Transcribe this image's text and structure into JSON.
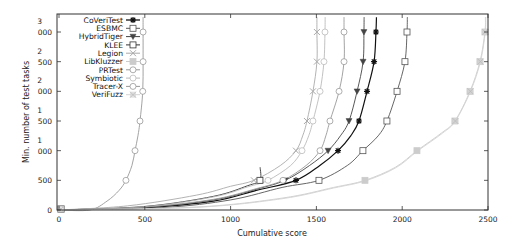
{
  "chart_data": {
    "type": "line",
    "title": "",
    "xlabel": "Cumulative score",
    "ylabel": "Min. number of test tasks",
    "xlim": [
      0,
      2500
    ],
    "ylim": [
      0,
      3000
    ],
    "x_ticks": [
      0,
      500,
      1000,
      1500,
      2000,
      2500
    ],
    "x_tick_labels": [
      "0",
      "500",
      "1000",
      "1500",
      "2000",
      "2500"
    ],
    "y_ticks": [
      0,
      500,
      1000,
      1500,
      2000,
      2500,
      3000
    ],
    "y_tick_labels": [
      [
        "0"
      ],
      [
        "500"
      ],
      [
        "1",
        "000"
      ],
      [
        "1",
        "500"
      ],
      [
        "2",
        "000"
      ],
      [
        "2",
        "500"
      ],
      [
        "3",
        "000"
      ]
    ],
    "grid": false,
    "legend_position": "top-left",
    "series": [
      {
        "name": "CoVeriTest",
        "color": "#111111",
        "marker": "star",
        "points": [
          [
            0,
            0
          ],
          [
            500,
            40
          ],
          [
            900,
            150
          ],
          [
            1150,
            330
          ],
          [
            1381,
            500
          ],
          [
            1520,
            750
          ],
          [
            1626,
            1000
          ],
          [
            1700,
            1250
          ],
          [
            1748,
            1500
          ],
          [
            1795,
            2000
          ],
          [
            1836,
            2500
          ],
          [
            1847,
            3000
          ],
          [
            1850,
            3250
          ]
        ]
      },
      {
        "name": "ESBMC",
        "color": "#555555",
        "marker": "square",
        "points": [
          [
            0,
            0
          ],
          [
            600,
            40
          ],
          [
            1000,
            170
          ],
          [
            1300,
            380
          ],
          [
            1515,
            500
          ],
          [
            1680,
            750
          ],
          [
            1771,
            1000
          ],
          [
            1860,
            1250
          ],
          [
            1911,
            1500
          ],
          [
            1970,
            2000
          ],
          [
            2016,
            2500
          ],
          [
            2028,
            3000
          ],
          [
            2030,
            3250
          ]
        ]
      },
      {
        "name": "HybridTiger",
        "color": "#444444",
        "marker": "triangle-down",
        "points": [
          [
            0,
            0
          ],
          [
            500,
            45
          ],
          [
            900,
            170
          ],
          [
            1150,
            350
          ],
          [
            1317,
            500
          ],
          [
            1460,
            750
          ],
          [
            1568,
            1000
          ],
          [
            1640,
            1250
          ],
          [
            1690,
            1500
          ],
          [
            1737,
            2000
          ],
          [
            1772,
            2500
          ],
          [
            1777,
            3000
          ],
          [
            1778,
            3250
          ]
        ]
      },
      {
        "name": "KLEE",
        "color": "#333333",
        "marker": "square",
        "points": [
          [
            0,
            0
          ],
          [
            500,
            60
          ],
          [
            900,
            230
          ],
          [
            1100,
            410
          ],
          [
            1171,
            500
          ],
          [
            1172,
            720
          ]
        ]
      },
      {
        "name": "Legion",
        "color": "#aaaaaa",
        "marker": "x",
        "points": [
          [
            0,
            0
          ],
          [
            400,
            70
          ],
          [
            800,
            250
          ],
          [
            1000,
            400
          ],
          [
            1136,
            500
          ],
          [
            1290,
            750
          ],
          [
            1381,
            1000
          ],
          [
            1420,
            1250
          ],
          [
            1445,
            1500
          ],
          [
            1480,
            2000
          ],
          [
            1503,
            2500
          ],
          [
            1503,
            3000
          ],
          [
            1503,
            3250
          ]
        ]
      },
      {
        "name": "LibKluzzer",
        "color": "#cccccc",
        "marker": "filled-square",
        "points": [
          [
            0,
            0
          ],
          [
            800,
            50
          ],
          [
            1300,
            200
          ],
          [
            1600,
            380
          ],
          [
            1783,
            500
          ],
          [
            1960,
            720
          ],
          [
            2086,
            1000
          ],
          [
            2230,
            1300
          ],
          [
            2307,
            1500
          ],
          [
            2395,
            2000
          ],
          [
            2453,
            2500
          ],
          [
            2482,
            3000
          ],
          [
            2485,
            3250
          ]
        ]
      },
      {
        "name": "PRTest",
        "color": "#999999",
        "marker": "circle",
        "points": [
          [
            0,
            0
          ],
          [
            180,
            0
          ],
          [
            280,
            150
          ],
          [
            350,
            330
          ],
          [
            390,
            500
          ],
          [
            425,
            750
          ],
          [
            443,
            1000
          ],
          [
            460,
            1250
          ],
          [
            472,
            1500
          ],
          [
            488,
            2000
          ],
          [
            490,
            2500
          ],
          [
            490,
            3000
          ],
          [
            490,
            3250
          ]
        ]
      },
      {
        "name": "Symbiotic",
        "color": "#bbbbbb",
        "marker": "circle",
        "points": [
          [
            0,
            0
          ],
          [
            500,
            55
          ],
          [
            900,
            220
          ],
          [
            1100,
            390
          ],
          [
            1218,
            500
          ],
          [
            1350,
            750
          ],
          [
            1416,
            1000
          ],
          [
            1455,
            1250
          ],
          [
            1480,
            1500
          ],
          [
            1521,
            2000
          ],
          [
            1544,
            2500
          ],
          [
            1550,
            3000
          ],
          [
            1551,
            3250
          ]
        ]
      },
      {
        "name": "Tracer-X",
        "color": "#999999",
        "marker": "circle",
        "points": [
          [
            0,
            0
          ],
          [
            500,
            50
          ],
          [
            900,
            180
          ],
          [
            1150,
            360
          ],
          [
            1305,
            500
          ],
          [
            1440,
            750
          ],
          [
            1521,
            1000
          ],
          [
            1555,
            1250
          ],
          [
            1579,
            1500
          ],
          [
            1632,
            2000
          ],
          [
            1661,
            2500
          ],
          [
            1661,
            3000
          ],
          [
            1661,
            3250
          ]
        ]
      },
      {
        "name": "VeriFuzz",
        "color": "#d4d4d4",
        "marker": "x-filled",
        "points": [
          [
            0,
            0
          ],
          [
            800,
            45
          ],
          [
            1300,
            190
          ],
          [
            1600,
            370
          ],
          [
            1790,
            495
          ],
          [
            1965,
            715
          ],
          [
            2090,
            995
          ],
          [
            2235,
            1295
          ],
          [
            2310,
            1500
          ],
          [
            2398,
            2000
          ],
          [
            2456,
            2500
          ],
          [
            2484,
            3000
          ],
          [
            2487,
            3250
          ]
        ]
      }
    ]
  }
}
